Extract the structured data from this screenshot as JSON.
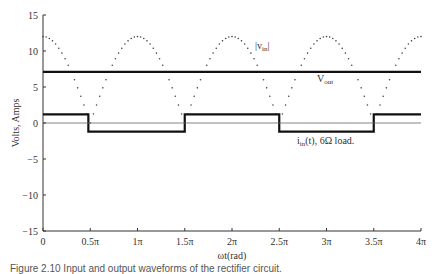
{
  "chart_data": {
    "type": "line",
    "title": "",
    "xlabel": "ωt(rad)",
    "ylabel": "Volts, Amps",
    "xlim": [
      0,
      4
    ],
    "xlim_units": "π",
    "ylim": [
      -15,
      15
    ],
    "grid": false,
    "x_ticks": [
      "0",
      "0.5π",
      "1π",
      "1.5π",
      "2π",
      "2.5π",
      "3π",
      "3.5π",
      "4π"
    ],
    "y_ticks": [
      "15",
      "10",
      "5",
      "0",
      "−5",
      "−10",
      "−15"
    ],
    "series": [
      {
        "name": "|v_in|",
        "style": "dotted",
        "description": "Rectified sinusoid, 12·|cos(ωt)|",
        "amplitude": 12,
        "x": [
          0,
          0.5,
          1,
          1.5,
          2,
          2.5,
          3,
          3.5,
          4
        ],
        "values": [
          12,
          0,
          12,
          0,
          12,
          0,
          12,
          0,
          12
        ]
      },
      {
        "name": "V_out",
        "style": "solid-thick",
        "description": "Constant DC output",
        "x": [
          0,
          4
        ],
        "values": [
          7.1,
          7.1
        ]
      },
      {
        "name": "i_in(t), 6Ω load.",
        "style": "solid-thick",
        "description": "Square-wave input current",
        "x": [
          0,
          0.48,
          0.48,
          1.5,
          1.5,
          2.5,
          2.5,
          3.5,
          3.5,
          4
        ],
        "values": [
          1.2,
          1.2,
          -1.2,
          -1.2,
          1.2,
          1.2,
          -1.2,
          -1.2,
          1.2,
          1.2
        ]
      },
      {
        "name": "zero line",
        "style": "thin",
        "x": [
          0,
          4
        ],
        "values": [
          0,
          0
        ]
      }
    ],
    "annotations": [
      {
        "text": "|v_in|",
        "x": 2.35,
        "y": 9.8
      },
      {
        "text": "V_out",
        "x": 2.65,
        "y": 4.5
      },
      {
        "text": "i_in(t), 6Ω load.",
        "x": 2.6,
        "y": -2.5
      }
    ]
  },
  "labels": {
    "ylabel": "Volts, Amps",
    "xlabel": "ωt(rad)",
    "vin_main": "|v",
    "vin_sub": "in",
    "vin_end": "|",
    "vout_main": "V",
    "vout_sub": "out",
    "iin_main": "i",
    "iin_sub": "in",
    "iin_end": "(t), 6Ω load."
  },
  "caption": "Figure 2.10   Input and output waveforms of the rectifier circuit."
}
